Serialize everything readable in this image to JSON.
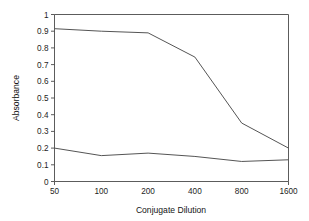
{
  "chart_data": {
    "type": "line",
    "title": "",
    "xlabel": "Conjugate Dilution",
    "ylabel": "Absorbance",
    "categories": [
      "50",
      "100",
      "200",
      "400",
      "800",
      "1600"
    ],
    "x_tick_labels": [
      "50",
      "100",
      "200",
      "400",
      "800",
      "1600"
    ],
    "y_tick_labels": [
      "0",
      "0.1",
      "0.2",
      "0.3",
      "0.4",
      "0.5",
      "0.6",
      "0.7",
      "0.8",
      "0.9",
      "1"
    ],
    "y_tick_values": [
      0,
      0.1,
      0.2,
      0.3,
      0.4,
      0.5,
      0.6,
      0.7,
      0.8,
      0.9,
      1
    ],
    "ylim": [
      0,
      1
    ],
    "grid": false,
    "legend": "none",
    "series": [
      {
        "name": "upper-curve",
        "color": "#555555",
        "values": [
          0.915,
          0.9,
          0.89,
          0.745,
          0.35,
          0.2
        ]
      },
      {
        "name": "lower-curve",
        "color": "#555555",
        "values": [
          0.2,
          0.155,
          0.17,
          0.15,
          0.12,
          0.13
        ]
      }
    ]
  },
  "axes": {
    "y_label": "Absorbance",
    "x_label": "Conjugate Dilution"
  }
}
